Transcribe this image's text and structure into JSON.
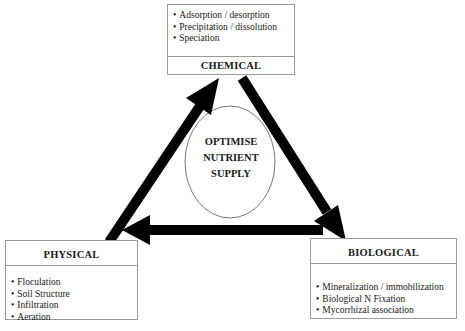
{
  "diagram": {
    "center": {
      "lines": [
        "OPTIMISE",
        "NUTRIENT",
        "SUPPLY"
      ]
    },
    "nodes": {
      "chemical": {
        "title": "CHEMICAL",
        "items": [
          "Adsorption / desorption",
          "Precipitation / dissolution",
          "Speciation"
        ]
      },
      "physical": {
        "title": "PHYSICAL",
        "items": [
          "Floculation",
          "Soil Structure",
          "Infiltration",
          "Aeration"
        ]
      },
      "biological": {
        "title": "BIOLOGICAL",
        "items": [
          "Mineralization / immobilization",
          "Biological N Fixation",
          "Mycorrhizal association"
        ]
      }
    },
    "edges": [
      {
        "from": "physical",
        "to": "chemical"
      },
      {
        "from": "chemical",
        "to": "biological"
      },
      {
        "from": "biological",
        "to": "physical"
      }
    ],
    "colors": {
      "arrow": "#000000",
      "border": "#9a9a9a",
      "ellipse_stroke": "#555555"
    }
  }
}
